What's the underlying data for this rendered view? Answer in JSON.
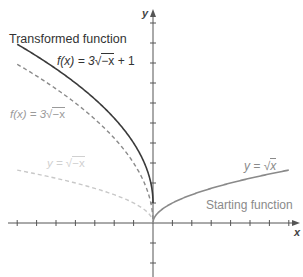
{
  "chart_data": {
    "type": "line",
    "title": "",
    "xlabel": "x",
    "ylabel": "y",
    "xlim": [
      -7,
      7
    ],
    "ylim": [
      -2,
      10
    ],
    "grid": false,
    "tick_step": 1,
    "series": [
      {
        "name": "y = √x",
        "formula": "sqrt(x)",
        "domain": [
          0,
          7
        ],
        "style": "solid",
        "color": "#8a8a8a",
        "annotation": "Starting function",
        "x": [
          0,
          1,
          2,
          3,
          4,
          5,
          6,
          7
        ],
        "y": [
          0,
          1,
          1.41,
          1.73,
          2,
          2.24,
          2.45,
          2.65
        ]
      },
      {
        "name": "y = √−x",
        "formula": "sqrt(-x)",
        "domain": [
          -7,
          0
        ],
        "style": "dashed",
        "color": "#c8c8c8",
        "x": [
          -7,
          -6,
          -5,
          -4,
          -3,
          -2,
          -1,
          0
        ],
        "y": [
          2.65,
          2.45,
          2.24,
          2,
          1.73,
          1.41,
          1,
          0
        ]
      },
      {
        "name": "f(x) = 3√−x",
        "formula": "3*sqrt(-x)",
        "domain": [
          -7,
          0
        ],
        "style": "dashed",
        "color": "#8a8a8a",
        "x": [
          -7,
          -6,
          -5,
          -4,
          -3,
          -2,
          -1,
          0
        ],
        "y": [
          7.94,
          7.35,
          6.71,
          6,
          5.2,
          4.24,
          3,
          0
        ]
      },
      {
        "name": "f(x) = 3√−x + 1",
        "formula": "3*sqrt(-x)+1",
        "domain": [
          -7,
          0
        ],
        "style": "solid",
        "color": "#3a3a3a",
        "annotation": "Transformed function",
        "x": [
          -7,
          -6,
          -5,
          -4,
          -3,
          -2,
          -1,
          0
        ],
        "y": [
          8.94,
          8.35,
          7.71,
          7,
          6.2,
          5.24,
          4,
          1
        ]
      }
    ]
  },
  "labels": {
    "transformed": "Transformed function",
    "starting": "Starting function",
    "f_shift_prefix": "f(x) = 3",
    "f_shift_rad": "−x",
    "f_shift_suffix": " + 1",
    "f_stretch_prefix": "f(x) = 3",
    "f_stretch_rad": "−x",
    "reflect_prefix": "y = ",
    "reflect_rad": "−x",
    "sqrt_prefix": "y = ",
    "sqrt_rad": "x",
    "x_axis": "x",
    "y_axis": "y"
  }
}
